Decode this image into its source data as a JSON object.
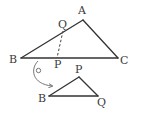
{
  "diagram": {
    "type": "geometry-triangle-fold",
    "main_triangle": {
      "vertices": {
        "A": {
          "label": "A",
          "x": 83,
          "y": 20,
          "lx": 78,
          "ly": 14
        },
        "B": {
          "label": "B",
          "x": 21,
          "y": 58,
          "lx": 9,
          "ly": 63
        },
        "C": {
          "label": "C",
          "x": 118,
          "y": 58,
          "lx": 120,
          "ly": 64
        }
      },
      "points": {
        "Q": {
          "label": "Q",
          "x": 63,
          "y": 31,
          "lx": 58,
          "ly": 28,
          "on_segment": "AB"
        },
        "P": {
          "label": "P",
          "x": 57,
          "y": 58,
          "lx": 54,
          "ly": 68,
          "on_segment": "BC"
        }
      },
      "dashed_segment": [
        "Q",
        "P"
      ]
    },
    "cut_triangle": {
      "vertices": {
        "P": {
          "label": "P",
          "x": 79,
          "y": 77,
          "lx": 75,
          "ly": 73
        },
        "B": {
          "label": "B",
          "x": 49,
          "y": 96,
          "lx": 38,
          "ly": 102
        },
        "Q": {
          "label": "Q",
          "x": 98,
          "y": 96,
          "lx": 97,
          "ly": 106
        }
      }
    },
    "rotation_arrow": {
      "from": {
        "x": 38,
        "y": 61
      },
      "to": {
        "x": 52,
        "y": 86
      },
      "pivot_circle": {
        "x": 38.5,
        "y": 70.5,
        "r": 2.2
      }
    },
    "colors": {
      "line": "#333333",
      "label": "#3a3a3a",
      "arrow": "#666666",
      "background": "#ffffff"
    }
  }
}
